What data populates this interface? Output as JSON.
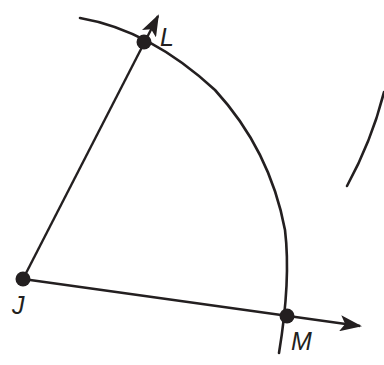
{
  "diagram": {
    "type": "geometric-construction",
    "stroke_color": "#231f20",
    "background": "#ffffff",
    "points": [
      {
        "name": "J",
        "label": "J",
        "x": 23,
        "y": 279
      },
      {
        "name": "L",
        "label": "L",
        "x": 144,
        "y": 42
      },
      {
        "name": "M",
        "label": "M",
        "x": 287,
        "y": 316
      }
    ],
    "rays": [
      {
        "from": "J",
        "through": "L",
        "label": "ray JL"
      },
      {
        "from": "J",
        "through": "M",
        "label": "ray JM"
      }
    ],
    "arcs": [
      {
        "center": "J",
        "radius": 266,
        "through": [
          "L",
          "M"
        ]
      },
      {
        "note": "partial arc fragment on right edge"
      }
    ]
  }
}
